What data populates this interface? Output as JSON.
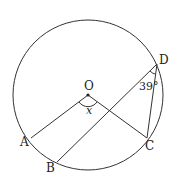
{
  "diagram": {
    "type": "circle-geometry",
    "stroke_color": "#333333",
    "circle": {
      "center_label": "O",
      "cx": 88,
      "cy": 95,
      "r": 75
    },
    "points": {
      "O": {
        "label": "O",
        "x": 88,
        "y": 95
      },
      "A": {
        "label": "A",
        "x": 31,
        "y": 138
      },
      "B": {
        "label": "B",
        "x": 57,
        "y": 162
      },
      "C": {
        "label": "C",
        "x": 147,
        "y": 138
      },
      "D": {
        "label": "D",
        "x": 157,
        "y": 64
      }
    },
    "segments": [
      "OA",
      "OC",
      "BD",
      "CD"
    ],
    "angles": {
      "AOC": {
        "label": "x"
      },
      "BDC": {
        "label": "39°"
      }
    }
  }
}
